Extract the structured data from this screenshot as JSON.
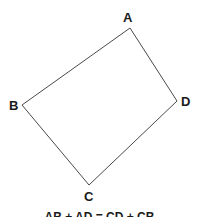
{
  "figure": {
    "background_color": "#ffffff",
    "stroke_color": "#4a4a4a",
    "stroke_width": 1,
    "label_color": "#1a1a1a",
    "caption": "AB + AD = CD + CB",
    "vertices": [
      {
        "id": "A",
        "label": "A",
        "x": 130,
        "y": 28
      },
      {
        "id": "B",
        "label": "B",
        "x": 22,
        "y": 105
      },
      {
        "id": "C",
        "label": "C",
        "x": 89,
        "y": 185
      },
      {
        "id": "D",
        "label": "D",
        "x": 177,
        "y": 101
      }
    ],
    "edges": [
      {
        "id": "AB",
        "from": "A",
        "to": "B"
      },
      {
        "id": "BC",
        "from": "B",
        "to": "C"
      },
      {
        "id": "CD",
        "from": "C",
        "to": "D"
      },
      {
        "id": "DA",
        "from": "D",
        "to": "A"
      }
    ],
    "polygon_points": "130,28 22,105 89,185 177,101"
  }
}
